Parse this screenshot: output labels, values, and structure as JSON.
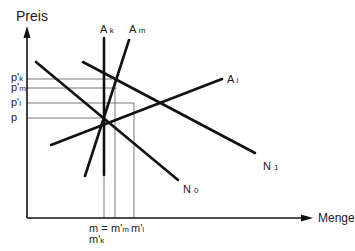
{
  "diagram": {
    "y_axis_title": "Preis",
    "x_axis_title": "Menge",
    "y_ticks": [
      {
        "label": "p'",
        "sub": "k",
        "y": 79
      },
      {
        "label": "p'",
        "sub": "m",
        "y": 88
      },
      {
        "label": "p'",
        "sub": "l",
        "y": 103
      },
      {
        "label": "p",
        "sub": "",
        "y": 118
      }
    ],
    "x_ticks": [
      {
        "label": "m =",
        "sub": "",
        "x": 104
      },
      {
        "label": "m'",
        "sub": "k",
        "x": 104
      },
      {
        "label": "m'",
        "sub": "m",
        "x": 115
      },
      {
        "label": "m'",
        "sub": "l",
        "x": 134
      }
    ],
    "curves": {
      "A_k": {
        "label": "A",
        "sub": "k"
      },
      "A_m": {
        "label": "A",
        "sub": "m"
      },
      "A_l": {
        "label": "A",
        "sub": "l"
      },
      "N_1": {
        "label": "N",
        "sub": "1"
      },
      "N_0": {
        "label": "N",
        "sub": "0"
      }
    },
    "colors": {
      "line": "#111111",
      "guide": "#555555",
      "background": "#ffffff"
    }
  }
}
